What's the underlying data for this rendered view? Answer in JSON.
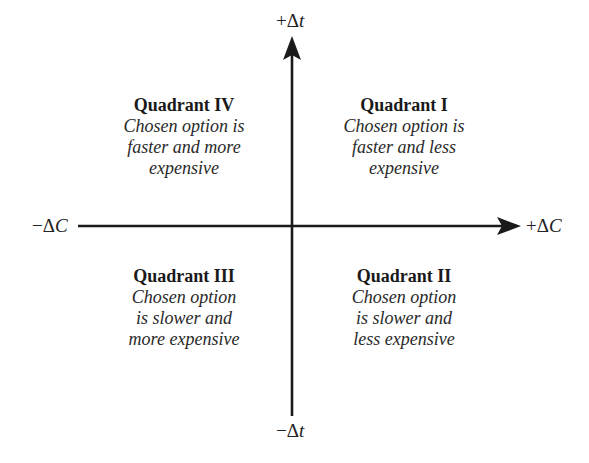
{
  "diagram": {
    "type": "quadrant",
    "axes": {
      "y_positive": {
        "sign": "+",
        "symbol": "Δ",
        "variable": "t"
      },
      "y_negative": {
        "sign": "−",
        "symbol": "Δ",
        "variable": "t"
      },
      "x_positive": {
        "sign": "+",
        "symbol": "Δ",
        "variable": "C"
      },
      "x_negative": {
        "sign": "−",
        "symbol": "Δ",
        "variable": "C"
      }
    },
    "quadrants": {
      "top_left": {
        "title": "Quadrant IV",
        "lines": [
          "Chosen option is",
          "faster and more",
          "expensive"
        ]
      },
      "top_right": {
        "title": "Quadrant I",
        "lines": [
          "Chosen option is",
          "faster and less",
          "expensive"
        ]
      },
      "bottom_left": {
        "title": "Quadrant III",
        "lines": [
          "Chosen option",
          "is slower and",
          "more expensive"
        ]
      },
      "bottom_right": {
        "title": "Quadrant II",
        "lines": [
          "Chosen option",
          "is slower and",
          "less expensive"
        ]
      }
    },
    "colors": {
      "axis": "#1a1a1a",
      "text": "#222222",
      "background": "#ffffff"
    }
  }
}
